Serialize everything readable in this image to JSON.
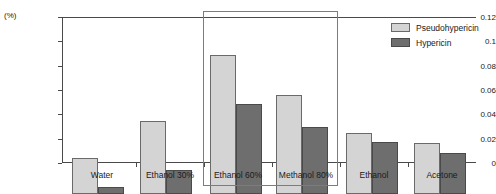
{
  "chart_data": {
    "type": "bar",
    "title": "",
    "subtitle": "",
    "xlabel": "",
    "ylabel": "(%)",
    "ylim": [
      0,
      0.12
    ],
    "grid": false,
    "legend_position": "top-right",
    "categories": [
      "Water",
      "Ethanol 30%",
      "Ethanol 60%",
      "Methanol 80%",
      "Ethanol",
      "Acetone"
    ],
    "ytick_labels": [
      "0.12",
      "0.1",
      "0.08",
      "0.06",
      "0.04",
      "0.02",
      "0"
    ],
    "ytick_values": [
      0.12,
      0.1,
      0.08,
      0.06,
      0.04,
      0.02,
      0
    ],
    "series": [
      {
        "name": "Pseudohypericin",
        "color": "#d4d4d4",
        "values": [
          0.03,
          0.06,
          0.114,
          0.081,
          0.05,
          0.042
        ]
      },
      {
        "name": "Hypericin",
        "color": "#6e6e6e",
        "values": [
          0.006,
          0.02,
          0.074,
          0.055,
          0.043,
          0.034
        ]
      }
    ],
    "annotations": [
      {
        "name": "highlight-box",
        "type": "rectangle",
        "covers": [
          "Ethanol 60%",
          "Methanol 80%"
        ],
        "color": "#6d7f92"
      }
    ]
  }
}
